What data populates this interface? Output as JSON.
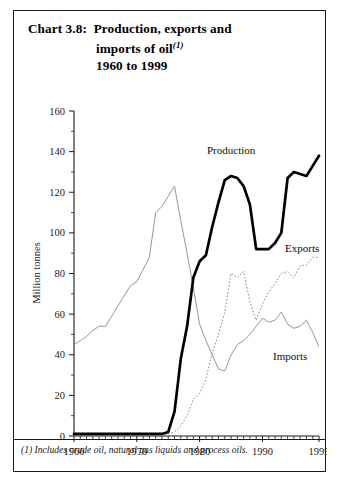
{
  "title": {
    "label": "Chart 3.8:",
    "line1": "Production, exports and",
    "line2": "imports of oil",
    "line2_superscript": "(1)",
    "line3": "1960 to 1999"
  },
  "footnote": "(1) Includes crude oil, natural gas liquids and process oils.",
  "labels": {
    "production": "Production",
    "exports": "Exports",
    "imports": "Imports"
  },
  "chart_data": {
    "type": "line",
    "xlabel": "",
    "ylabel": "Million tonnes",
    "xlim": [
      1960,
      1999
    ],
    "ylim": [
      0,
      160
    ],
    "ytick_labels": [
      "0",
      "20",
      "40",
      "60",
      "80",
      "100",
      "120",
      "140",
      "160"
    ],
    "ytick_values": [
      0,
      20,
      40,
      60,
      80,
      100,
      120,
      140,
      160
    ],
    "yminor_step": 10,
    "xtick_labels": [
      "1960",
      "1970",
      "1980",
      "1990",
      "1999"
    ],
    "xtick_values": [
      1960,
      1970,
      1980,
      1990,
      1999
    ],
    "xminor_step": 1,
    "grid": false,
    "legend_position": "inline-annotations",
    "x": [
      1960,
      1961,
      1962,
      1963,
      1964,
      1965,
      1966,
      1967,
      1968,
      1969,
      1970,
      1971,
      1972,
      1973,
      1974,
      1975,
      1976,
      1977,
      1978,
      1979,
      1980,
      1981,
      1982,
      1983,
      1984,
      1985,
      1986,
      1987,
      1988,
      1989,
      1990,
      1991,
      1992,
      1993,
      1994,
      1995,
      1996,
      1997,
      1998,
      1999
    ],
    "series": [
      {
        "name": "Production",
        "style": "thick-solid-black",
        "color": "#000000",
        "values": [
          1,
          1,
          1,
          1,
          1,
          1,
          1,
          1,
          1,
          1,
          1,
          1,
          1,
          1,
          1,
          2,
          12,
          38,
          54,
          78,
          86,
          89,
          103,
          115,
          126,
          128,
          127,
          123,
          114,
          92,
          92,
          92,
          95,
          100,
          127,
          130,
          129,
          128,
          133,
          138
        ]
      },
      {
        "name": "Exports",
        "style": "dotted-grey",
        "color": "#8a8a8a",
        "values": [
          0,
          0,
          0,
          0,
          0,
          0,
          0,
          0,
          0,
          0,
          1,
          1,
          1,
          1,
          1,
          1,
          2,
          5,
          10,
          18,
          21,
          28,
          41,
          50,
          61,
          80,
          78,
          81,
          66,
          57,
          65,
          71,
          75,
          80,
          81,
          78,
          84,
          84,
          88,
          88
        ]
      },
      {
        "name": "Imports",
        "style": "thin-solid-grey",
        "color": "#8a8a8a",
        "values": [
          45,
          47,
          49,
          52,
          54,
          54,
          59,
          64,
          69,
          74,
          76,
          82,
          88,
          110,
          113,
          118,
          123,
          106,
          90,
          73,
          55,
          47,
          40,
          33,
          32,
          40,
          45,
          47,
          50,
          54,
          58,
          56,
          57,
          61,
          55,
          53,
          54,
          57,
          51,
          44
        ]
      }
    ]
  }
}
